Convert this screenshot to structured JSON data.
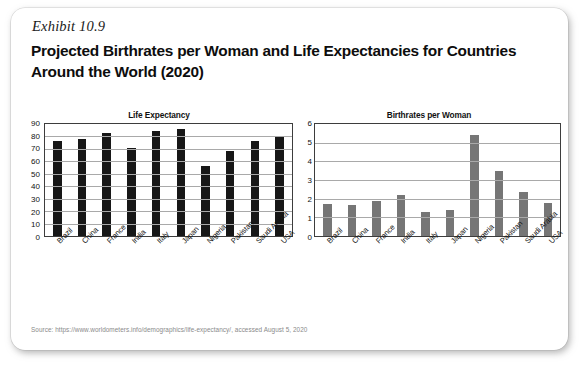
{
  "exhibit": {
    "label": "Exhibit 10.9",
    "title": "Projected Birthrates per Woman and Life Expectancies for Countries Around the World (2020)",
    "source": "Source: https://www.worldometers.info/demographics/life-expectancy/, accessed August 5, 2020"
  },
  "colors": {
    "life_bar": "#171717",
    "birth_bar": "#767676",
    "axis": "#3d3d3d",
    "gridline": "#a9a9a9",
    "card_background": "#ffffff"
  },
  "chart_data": [
    {
      "type": "bar",
      "title": "Life Expectancy",
      "xlabel": "",
      "ylabel": "",
      "ylim": [
        0,
        90
      ],
      "yticks": [
        0,
        10,
        20,
        30,
        40,
        50,
        60,
        70,
        80,
        90
      ],
      "grid": true,
      "legend": "none",
      "bar_color": "#171717",
      "categories": [
        "Brazil",
        "China",
        "France",
        "India",
        "Italy",
        "Japan",
        "Nigeria",
        "Pakistan",
        "Saudi Arabia",
        "USA"
      ],
      "values": [
        76.6,
        77.7,
        83.1,
        70.6,
        84.5,
        85.7,
        56.2,
        68.6,
        76.3,
        79.8
      ]
    },
    {
      "type": "bar",
      "title": "Birthrates per Woman",
      "xlabel": "",
      "ylabel": "",
      "ylim": [
        0,
        6
      ],
      "yticks": [
        0,
        1,
        2,
        3,
        4,
        5,
        6
      ],
      "grid": true,
      "legend": "none",
      "bar_color": "#767676",
      "categories": [
        "Brazil",
        "China",
        "France",
        "India",
        "Italy",
        "Japan",
        "Nigeria",
        "Pakistan",
        "Saudi Arabia",
        "USA"
      ],
      "values": [
        1.7,
        1.68,
        1.88,
        2.2,
        1.3,
        1.42,
        5.4,
        3.5,
        2.35,
        1.75
      ]
    }
  ]
}
